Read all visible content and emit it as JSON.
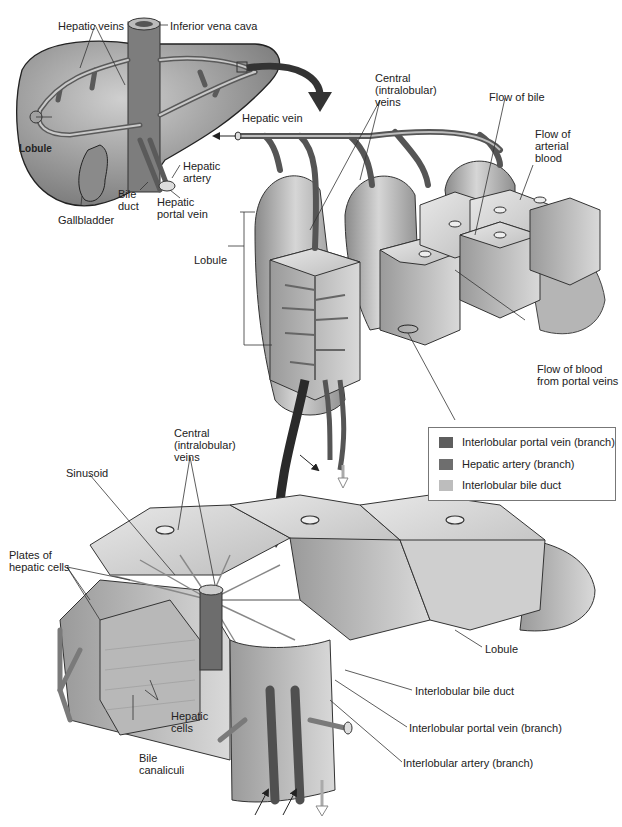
{
  "figure": {
    "type": "anatomical-diagram"
  },
  "labels": {
    "hepatic_veins": "Hepatic veins",
    "inferior_vena_cava": "Inferior vena cava",
    "lobule_liver": "Lobule",
    "gallbladder": "Gallbladder",
    "bile_duct": "Bile\nduct",
    "bile_duct_l1": "Bile",
    "bile_duct_l2": "duct",
    "hepatic_artery_l1": "Hepatic",
    "hepatic_artery_l2": "artery",
    "hepatic_portal_vein_l1": "Hepatic",
    "hepatic_portal_vein_l2": "portal vein",
    "hepatic_vein": "Hepatic vein",
    "central_veins_top_l1": "Central",
    "central_veins_top_l2": "(intralobular)",
    "central_veins_top_l3": "veins",
    "flow_of_bile": "Flow of bile",
    "flow_arterial_l1": "Flow of",
    "flow_arterial_l2": "arterial",
    "flow_arterial_l3": "blood",
    "lobule_mid": "Lobule",
    "flow_portal_l1": "Flow of blood",
    "flow_portal_l2": "from portal veins",
    "central_veins_bottom_l1": "Central",
    "central_veins_bottom_l2": "(intralobular)",
    "central_veins_bottom_l3": "veins",
    "sinusoid": "Sinusoid",
    "plates_l1": "Plates of",
    "plates_l2": "hepatic cells",
    "hepatic_cells_l1": "Hepatic",
    "hepatic_cells_l2": "cells",
    "bile_canaliculi_l1": "Bile",
    "bile_canaliculi_l2": "canaliculi",
    "lobule_bottom": "Lobule",
    "interlobular_bile_duct": "Interlobular bile duct",
    "interlobular_portal_vein": "Interlobular portal vein (branch)",
    "interlobular_artery": "Interlobular artery (branch)"
  },
  "legend": {
    "items": [
      {
        "label": "Interlobular portal vein (branch)",
        "color": "#5e5e5e"
      },
      {
        "label": "Hepatic artery (branch)",
        "color": "#6e6e6e"
      },
      {
        "label": "Interlobular bile duct",
        "color": "#bdbdbd"
      }
    ]
  }
}
